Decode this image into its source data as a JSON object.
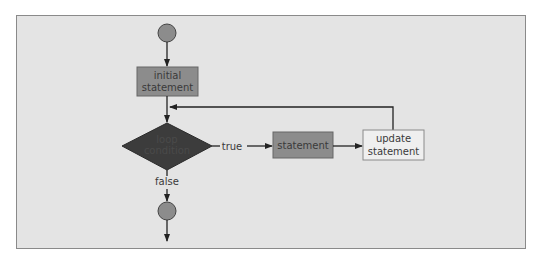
{
  "diagram": {
    "type": "flowchart",
    "colors": {
      "panel_bg": "#e4e4e4",
      "panel_border": "#8a8a8a",
      "terminal_fill": "#8c8c8c",
      "process_fill": "#8c8c8c",
      "decision_fill": "#3c3c3c",
      "update_fill": "#efefef",
      "line": "#222222"
    },
    "nodes": {
      "start": {
        "kind": "terminal-circle"
      },
      "initial": {
        "line1": "initial",
        "line2": "statement"
      },
      "condition": {
        "line1": "loop",
        "line2": "condition"
      },
      "statement": {
        "label": "statement"
      },
      "update": {
        "line1": "update",
        "line2": "statement"
      },
      "end": {
        "kind": "terminal-circle"
      }
    },
    "edges": {
      "true_label": "true",
      "false_label": "false"
    }
  }
}
